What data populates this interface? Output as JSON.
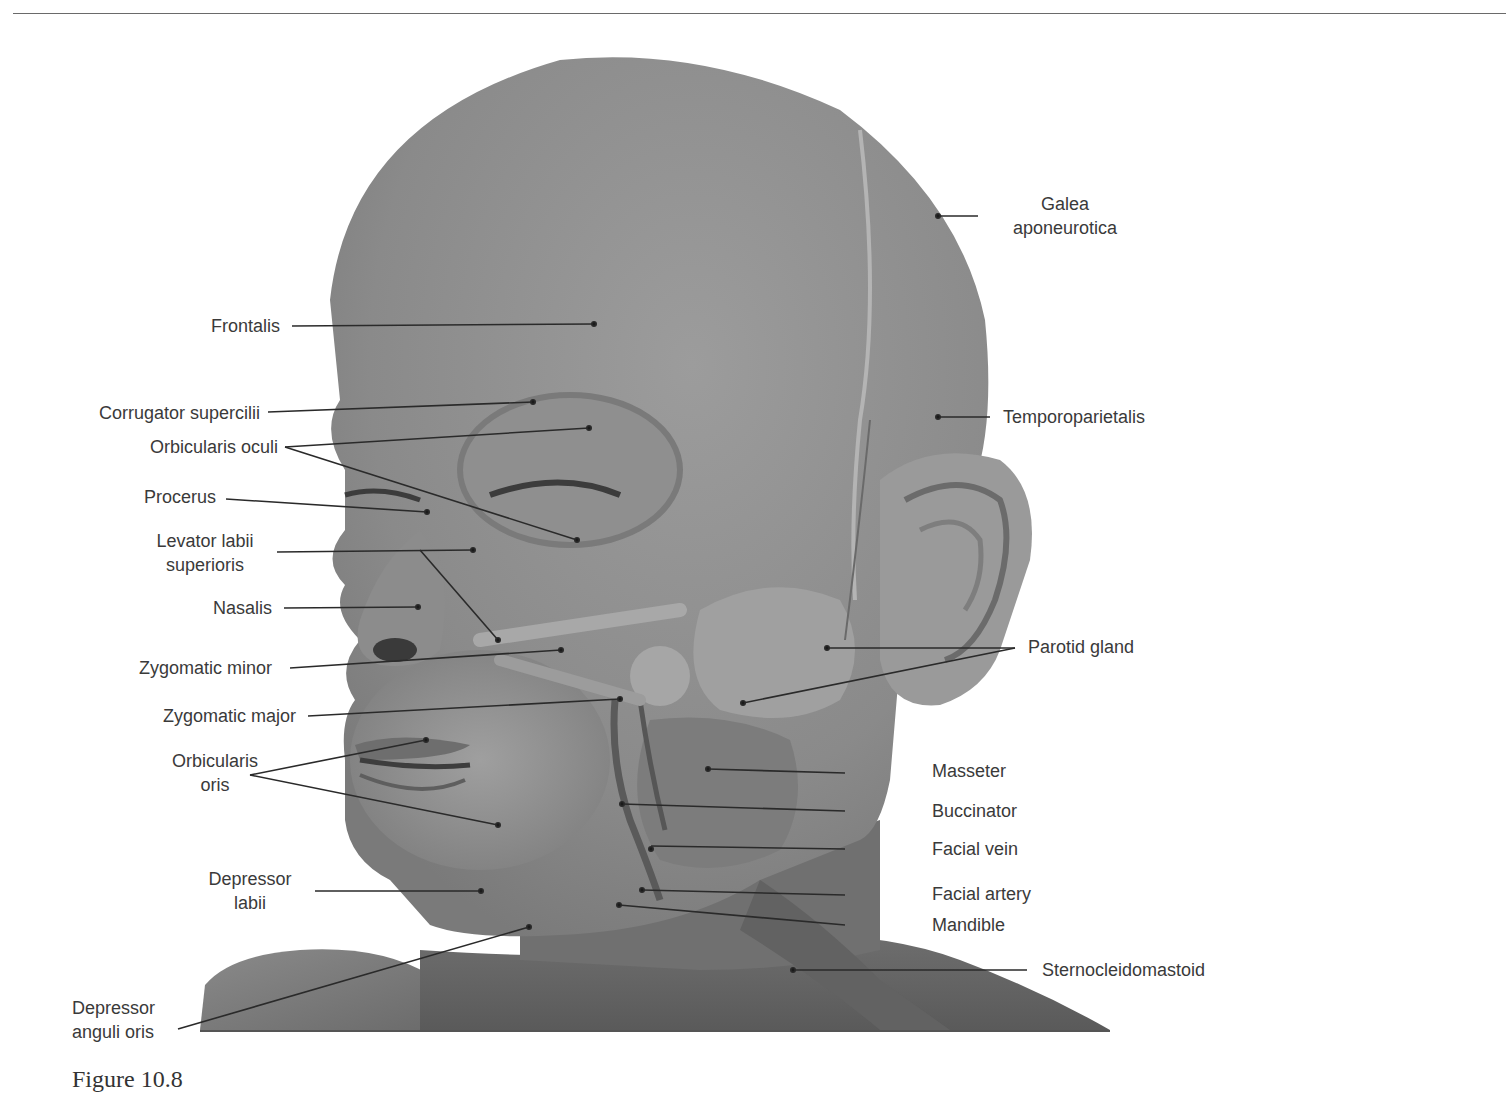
{
  "figure": {
    "caption_partial": "Figure 10.8",
    "colors": {
      "tissue": "#8e8e8e",
      "tissue_dark": "#6f6f6f",
      "tissue_light": "#a9a9a9",
      "label_text": "#3a3a3a",
      "leader_line": "#2a2a2a"
    }
  },
  "labels": {
    "galea": {
      "line1": "Galea",
      "line2": "aponeurotica"
    },
    "frontalis": "Frontalis",
    "corrugator": "Corrugator supercilii",
    "orbicularis_oculi": "Orbicularis oculi",
    "temporoparietalis": "Temporoparietalis",
    "procerus": "Procerus",
    "levator": {
      "line1": "Levator labii",
      "line2": "superioris"
    },
    "nasalis": "Nasalis",
    "zyg_minor": "Zygomatic minor",
    "parotid": "Parotid gland",
    "zyg_major": "Zygomatic major",
    "orbicularis_oris": {
      "line1": "Orbicularis",
      "line2": "oris"
    },
    "masseter": "Masseter",
    "buccinator": "Buccinator",
    "facial_vein": "Facial vein",
    "depressor_labii": {
      "line1": "Depressor",
      "line2": "labii"
    },
    "facial_artery": "Facial artery",
    "mandible": "Mandible",
    "sternocleidomastoid": "Sternocleidomastoid",
    "depressor_anguli": {
      "line1": "Depressor",
      "line2": "anguli oris"
    }
  }
}
